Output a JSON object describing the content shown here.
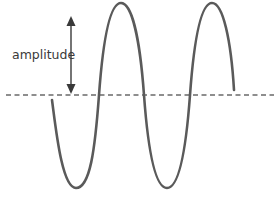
{
  "diagram": {
    "labels": {
      "amplitude": "amplitude"
    },
    "colors": {
      "wave": "#5a5a5a",
      "axis": "#6a6a6a",
      "arrow": "#3a3a3a",
      "text": "#3a3a3a"
    },
    "elements": [
      "sine-wave",
      "dashed-midline",
      "amplitude-arrow",
      "amplitude-label"
    ]
  }
}
